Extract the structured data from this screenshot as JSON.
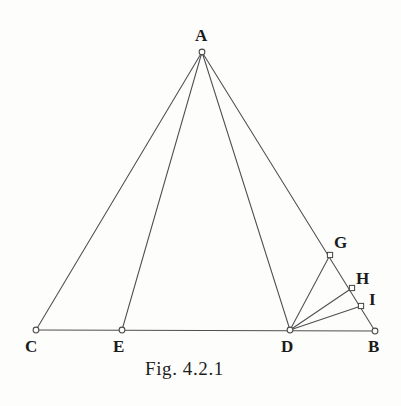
{
  "figure": {
    "caption": "Fig. 4.2.1",
    "background_color": "#fdfdfc",
    "line_color": "#4f4f52",
    "label_color": "#1b1b1b"
  },
  "points": {
    "A": {
      "label": "A",
      "x": 202,
      "y": 52,
      "marker": "circle"
    },
    "B": {
      "label": "B",
      "x": 375,
      "y": 331,
      "marker": "circle"
    },
    "C": {
      "label": "C",
      "x": 36,
      "y": 330,
      "marker": "circle"
    },
    "D": {
      "label": "D",
      "x": 290,
      "y": 330,
      "marker": "circle"
    },
    "E": {
      "label": "E",
      "x": 122,
      "y": 330,
      "marker": "circle"
    },
    "G": {
      "label": "G",
      "x": 330,
      "y": 255,
      "marker": "square"
    },
    "H": {
      "label": "H",
      "x": 352,
      "y": 288,
      "marker": "square"
    },
    "I": {
      "label": "I",
      "x": 361,
      "y": 306,
      "marker": "square"
    }
  },
  "segments": [
    {
      "name": "segment-A-C",
      "from": "A",
      "to": "C"
    },
    {
      "name": "segment-A-E",
      "from": "A",
      "to": "E"
    },
    {
      "name": "segment-A-D",
      "from": "A",
      "to": "D"
    },
    {
      "name": "segment-A-B",
      "from": "A",
      "to": "B"
    },
    {
      "name": "segment-C-B",
      "from": "C",
      "to": "B"
    },
    {
      "name": "segment-D-G",
      "from": "D",
      "to": "G"
    },
    {
      "name": "segment-D-H",
      "from": "D",
      "to": "H"
    },
    {
      "name": "segment-D-I",
      "from": "D",
      "to": "I"
    }
  ],
  "labels": {
    "A": {
      "text": "A",
      "x": 195,
      "y": 27
    },
    "B": {
      "text": "B",
      "x": 368,
      "y": 338
    },
    "C": {
      "text": "C",
      "x": 25,
      "y": 338
    },
    "D": {
      "text": "D",
      "x": 281,
      "y": 338
    },
    "E": {
      "text": "E",
      "x": 113,
      "y": 338
    },
    "G": {
      "text": "G",
      "x": 334,
      "y": 234
    },
    "H": {
      "text": "H",
      "x": 356,
      "y": 270
    },
    "I": {
      "text": "I",
      "x": 369,
      "y": 291
    }
  },
  "caption_position": {
    "x": 145,
    "y": 358
  }
}
